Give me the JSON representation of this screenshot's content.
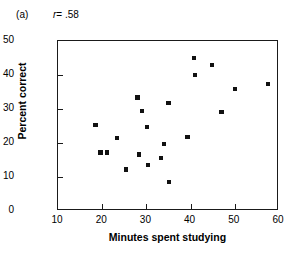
{
  "figure": {
    "panel_letter": "(a)",
    "correlation_symbol": "r",
    "correlation_text": "= .58",
    "correlation_full": "r = .58"
  },
  "chart_data": {
    "type": "scatter",
    "title": "",
    "subtitle": "",
    "xlabel": "Minutes spent studying",
    "ylabel": "Percent correct",
    "xlim": [
      10,
      60
    ],
    "ylim": [
      0,
      50
    ],
    "xticks": [
      10,
      20,
      30,
      40,
      50,
      60
    ],
    "yticks": [
      0,
      10,
      20,
      30,
      40,
      50
    ],
    "xtick_labels": [
      "10",
      "20",
      "30",
      "40",
      "50",
      "60"
    ],
    "ytick_labels": [
      "0",
      "10",
      "20",
      "30",
      "40",
      "50"
    ],
    "grid": false,
    "legend": false,
    "legend_position": "none",
    "annotations": [
      "(a)",
      "r = .58"
    ],
    "marker": "square",
    "marker_color": "#111111",
    "series": [
      {
        "name": "students",
        "points": [
          [
            18.5,
            25.3
          ],
          [
            19.6,
            17.2
          ],
          [
            21.0,
            17.2
          ],
          [
            23.3,
            21.4
          ],
          [
            25.3,
            12.2
          ],
          [
            28.0,
            33.4
          ],
          [
            28.4,
            16.6
          ],
          [
            29.0,
            29.5
          ],
          [
            30.2,
            24.6
          ],
          [
            30.3,
            13.6
          ],
          [
            33.3,
            15.5
          ],
          [
            34.0,
            19.6
          ],
          [
            35.0,
            31.7
          ],
          [
            35.2,
            8.6
          ],
          [
            39.3,
            21.8
          ],
          [
            40.8,
            44.9
          ],
          [
            41.0,
            40.0
          ],
          [
            44.8,
            43.0
          ],
          [
            47.0,
            29.0
          ],
          [
            50.0,
            36.0
          ],
          [
            57.5,
            37.3
          ]
        ]
      }
    ]
  }
}
